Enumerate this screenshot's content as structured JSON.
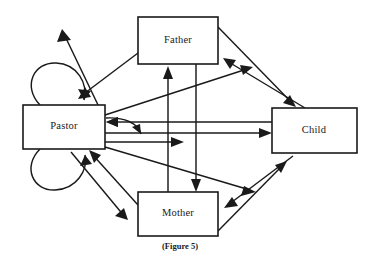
{
  "figure": {
    "caption": "(Figure 5)",
    "background_color": "#ffffff",
    "line_color": "#1a1a1a",
    "width": 373,
    "height": 264
  },
  "nodes": [
    {
      "id": "father",
      "label": "Father",
      "x": 138,
      "y": 17,
      "w": 80,
      "h": 47,
      "cx": 178,
      "cy": 41
    },
    {
      "id": "pastor",
      "label": "Pastor",
      "x": 23,
      "y": 105,
      "w": 82,
      "h": 44,
      "cx": 64,
      "cy": 127
    },
    {
      "id": "child",
      "label": "Child",
      "x": 272,
      "y": 108,
      "w": 85,
      "h": 45,
      "cx": 314,
      "cy": 131
    },
    {
      "id": "mother",
      "label": "Mother",
      "x": 138,
      "y": 192,
      "w": 80,
      "h": 44,
      "cx": 178,
      "cy": 214
    }
  ],
  "edges": [
    {
      "id": "pastor-to-father",
      "from": "pastor",
      "to": "father",
      "style": "single-arrow",
      "direction": "up-right"
    },
    {
      "id": "father-to-pastor",
      "from": "father",
      "to": "pastor",
      "style": "single-arrow",
      "direction": "down-left"
    },
    {
      "id": "pastor-to-mother",
      "from": "pastor",
      "to": "mother",
      "style": "single-arrow",
      "direction": "down-right"
    },
    {
      "id": "mother-to-pastor",
      "from": "mother",
      "to": "pastor",
      "style": "single-arrow",
      "direction": "up-left"
    },
    {
      "id": "father-to-child",
      "from": "father",
      "to": "child",
      "style": "single-arrow",
      "direction": "down-right"
    },
    {
      "id": "child-to-father",
      "from": "child",
      "to": "father",
      "style": "single-arrow",
      "direction": "up-left"
    },
    {
      "id": "child-to-mother",
      "from": "child",
      "to": "mother",
      "style": "single-arrow",
      "direction": "down-left"
    },
    {
      "id": "mother-to-child",
      "from": "mother",
      "to": "child",
      "style": "single-arrow",
      "direction": "up-right"
    },
    {
      "id": "mother-to-father",
      "from": "mother",
      "to": "father",
      "style": "single-arrow",
      "direction": "up"
    },
    {
      "id": "father-to-mother",
      "from": "father",
      "to": "mother",
      "style": "single-arrow",
      "direction": "down"
    },
    {
      "id": "child-to-pastor",
      "from": "child",
      "to": "pastor",
      "style": "single-arrow",
      "direction": "left"
    },
    {
      "id": "pastor-to-child",
      "from": "pastor",
      "to": "child",
      "style": "single-arrow",
      "direction": "right"
    },
    {
      "id": "pastor-to-child-upper",
      "from": "pastor",
      "to": "child",
      "style": "single-arrow",
      "direction": "up-right-diagonal"
    },
    {
      "id": "pastor-to-mother-inner",
      "from": "pastor",
      "to": "mother",
      "style": "single-arrow",
      "direction": "right-short"
    },
    {
      "id": "pastor-to-child-lower",
      "from": "pastor",
      "to": "child",
      "style": "single-arrow",
      "direction": "down-right-diagonal"
    }
  ],
  "self_loops": [
    {
      "id": "pastor-loop-upper",
      "node": "pastor",
      "position": "upper-left",
      "style": "single-arrow"
    },
    {
      "id": "pastor-loop-lower",
      "node": "pastor",
      "position": "lower-left",
      "style": "single-arrow"
    },
    {
      "id": "pastor-loop-right",
      "node": "pastor",
      "position": "right-inner",
      "style": "single-arrow"
    }
  ]
}
